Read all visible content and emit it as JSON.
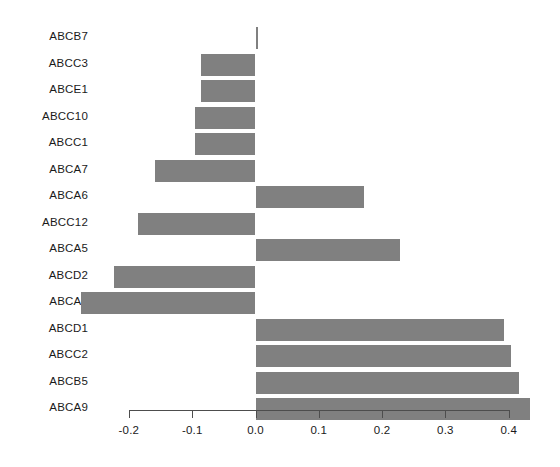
{
  "chart_data": {
    "type": "bar",
    "orientation": "horizontal",
    "title": "",
    "xlabel": "",
    "ylabel": "",
    "grid": false,
    "legend": null,
    "xlim": [
      -0.26,
      0.44
    ],
    "xticks": [
      -0.2,
      -0.1,
      0.0,
      0.1,
      0.2,
      0.3,
      0.4
    ],
    "xtick_labels": [
      "-0.2",
      "-0.1",
      "0.0",
      "0.1",
      "0.2",
      "0.3",
      "0.4"
    ],
    "categories": [
      "ABCB7",
      "ABCC3",
      "ABCE1",
      "ABCC10",
      "ABCC1",
      "ABCA7",
      "ABCA6",
      "ABCC12",
      "ABCA5",
      "ABCD2",
      "ABCA3",
      "ABCD1",
      "ABCC2",
      "ABCB5",
      "ABCA9"
    ],
    "values": [
      0.003,
      -0.086,
      -0.086,
      -0.096,
      -0.096,
      -0.158,
      0.171,
      -0.185,
      0.229,
      -0.223,
      -0.275,
      0.392,
      0.403,
      0.416,
      0.433
    ],
    "bar_color": "#808080",
    "axis_color": "#4d4d4d",
    "background_color": "#ffffff"
  }
}
